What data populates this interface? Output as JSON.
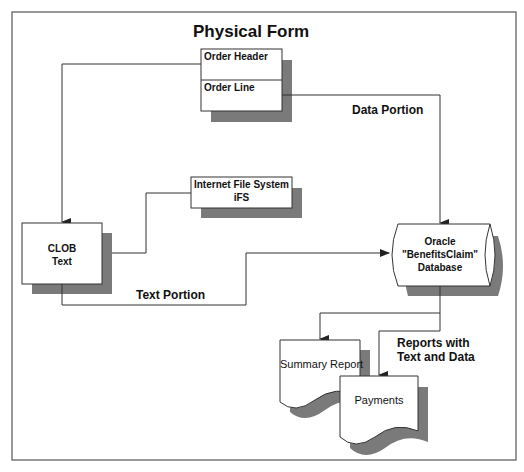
{
  "title": "Physical Form",
  "colors": {
    "line": "#333333",
    "frame": "#555555",
    "shadow": "#7a7a7a",
    "box_fill": "#ffffff"
  },
  "nodes": {
    "physical_form": {
      "sections": [
        "Order Header",
        "Order Line"
      ]
    },
    "clob": {
      "line1": "CLOB",
      "line2": "Text"
    },
    "ifs": {
      "line1": "Internet File System",
      "line2": "iFS"
    },
    "database": {
      "line1": "Oracle",
      "line2": "\"BenefitsClaim\"",
      "line3": "Database"
    },
    "summary_report": {
      "label": "Summary Report"
    },
    "payments": {
      "label": "Payments"
    }
  },
  "edges": {
    "data_portion": "Data Portion",
    "text_portion": "Text Portion",
    "reports": {
      "line1": "Reports with",
      "line2": "Text and Data"
    }
  }
}
